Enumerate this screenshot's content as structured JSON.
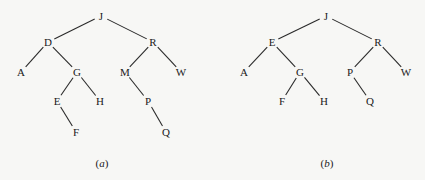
{
  "trees": [
    {
      "id": "a",
      "caption": "(a)",
      "caption_pos": [
        102,
        163
      ],
      "nodes": [
        {
          "id": "J",
          "label": "J",
          "x": 101,
          "y": 16
        },
        {
          "id": "D",
          "label": "D",
          "x": 48,
          "y": 42
        },
        {
          "id": "R",
          "label": "R",
          "x": 153,
          "y": 42
        },
        {
          "id": "A",
          "label": "A",
          "x": 21,
          "y": 72
        },
        {
          "id": "G",
          "label": "G",
          "x": 77,
          "y": 72
        },
        {
          "id": "M",
          "label": "M",
          "x": 125,
          "y": 72
        },
        {
          "id": "W",
          "label": "W",
          "x": 181,
          "y": 72
        },
        {
          "id": "E",
          "label": "E",
          "x": 57,
          "y": 101
        },
        {
          "id": "H",
          "label": "H",
          "x": 100,
          "y": 101
        },
        {
          "id": "P",
          "label": "P",
          "x": 148,
          "y": 101
        },
        {
          "id": "F",
          "label": "F",
          "x": 76,
          "y": 132
        },
        {
          "id": "Q",
          "label": "Q",
          "x": 166,
          "y": 132
        }
      ],
      "edges": [
        [
          "J",
          "D"
        ],
        [
          "J",
          "R"
        ],
        [
          "D",
          "A"
        ],
        [
          "D",
          "G"
        ],
        [
          "R",
          "M"
        ],
        [
          "R",
          "W"
        ],
        [
          "G",
          "E"
        ],
        [
          "G",
          "H"
        ],
        [
          "M",
          "P"
        ],
        [
          "E",
          "F"
        ],
        [
          "P",
          "Q"
        ]
      ]
    },
    {
      "id": "b",
      "caption": "(b)",
      "caption_pos": [
        327,
        163
      ],
      "nodes": [
        {
          "id": "J",
          "label": "J",
          "x": 326,
          "y": 16
        },
        {
          "id": "E",
          "label": "E",
          "x": 272,
          "y": 42
        },
        {
          "id": "R",
          "label": "R",
          "x": 378,
          "y": 42
        },
        {
          "id": "A",
          "label": "A",
          "x": 244,
          "y": 72
        },
        {
          "id": "G",
          "label": "G",
          "x": 300,
          "y": 72
        },
        {
          "id": "P",
          "label": "P",
          "x": 350,
          "y": 72
        },
        {
          "id": "W",
          "label": "W",
          "x": 406,
          "y": 72
        },
        {
          "id": "F",
          "label": "F",
          "x": 282,
          "y": 101
        },
        {
          "id": "H",
          "label": "H",
          "x": 324,
          "y": 101
        },
        {
          "id": "Q",
          "label": "Q",
          "x": 370,
          "y": 101
        }
      ],
      "edges": [
        [
          "J",
          "E"
        ],
        [
          "J",
          "R"
        ],
        [
          "E",
          "A"
        ],
        [
          "E",
          "G"
        ],
        [
          "R",
          "P"
        ],
        [
          "R",
          "W"
        ],
        [
          "G",
          "F"
        ],
        [
          "G",
          "H"
        ],
        [
          "P",
          "Q"
        ]
      ]
    }
  ]
}
